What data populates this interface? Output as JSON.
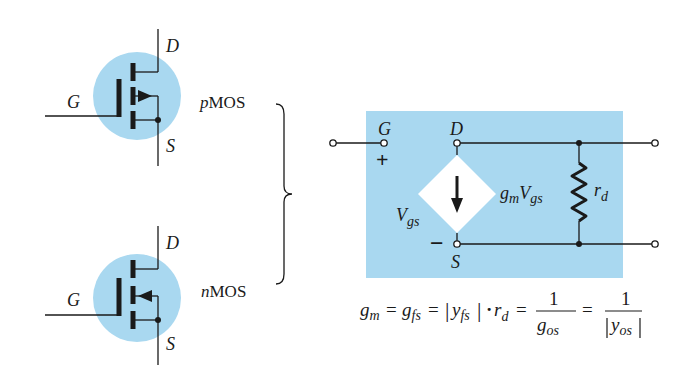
{
  "colors": {
    "background": "#ffffff",
    "circle_fill": "#a9d8f0",
    "panel_fill": "#a9d8f0",
    "ink": "#1a1a1a",
    "diamond_fill": "#ffffff"
  },
  "pmos": {
    "type_prefix": "p",
    "type_suffix": "MOS",
    "gate_label": "G",
    "drain_label": "D",
    "source_label": "S",
    "arrow_direction": "outward"
  },
  "nmos": {
    "type_prefix": "n",
    "type_suffix": "MOS",
    "gate_label": "G",
    "drain_label": "D",
    "source_label": "S",
    "arrow_direction": "inward"
  },
  "equivalent_circuit": {
    "gate_label": "G",
    "drain_label": "D",
    "source_label": "S",
    "plus_sign": "+",
    "minus_sign": "−",
    "vgs_main": "V",
    "vgs_sub": "gs",
    "source_gm": "g",
    "source_gm_sub": "m",
    "source_v": "V",
    "source_v_sub": "gs",
    "resistor_main": "r",
    "resistor_sub": "d"
  },
  "formula": {
    "gm": "g",
    "gm_sub": "m",
    "eq": "=",
    "gfs": "g",
    "gfs_sub": "fs",
    "yfs": "y",
    "yfs_sub": "fs",
    "bar": "|",
    "dot": "·",
    "rd": "r",
    "rd_sub": "d",
    "one": "1",
    "gos": "g",
    "gos_sub": "os",
    "yos": "y",
    "yos_sub": "os"
  }
}
